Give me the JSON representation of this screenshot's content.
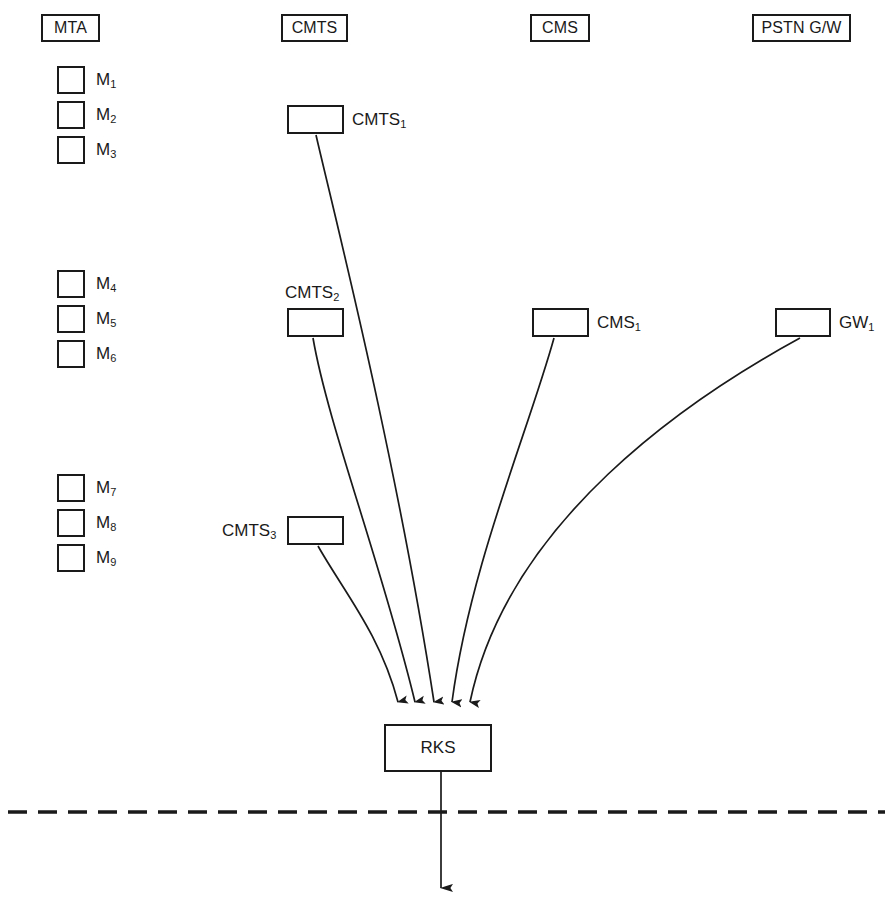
{
  "diagram": {
    "stroke_color": "#1a1a1a",
    "background_color": "#ffffff",
    "columns": [
      {
        "id": "mta",
        "label": "MTA",
        "x": 41,
        "y": 14,
        "w": 59,
        "h": 28
      },
      {
        "id": "cmts",
        "label": "CMTS",
        "x": 281,
        "y": 14,
        "w": 67,
        "h": 28
      },
      {
        "id": "cms",
        "label": "CMS",
        "x": 530,
        "y": 14,
        "w": 60,
        "h": 28
      },
      {
        "id": "pstn",
        "label": "PSTN G/W",
        "x": 752,
        "y": 14,
        "w": 99,
        "h": 28
      }
    ],
    "mta_terminals": [
      {
        "id": "m1",
        "base": "M",
        "sub": "1",
        "x": 57,
        "y": 66
      },
      {
        "id": "m2",
        "base": "M",
        "sub": "2",
        "x": 57,
        "y": 101
      },
      {
        "id": "m3",
        "base": "M",
        "sub": "3",
        "x": 57,
        "y": 136
      },
      {
        "id": "m4",
        "base": "M",
        "sub": "4",
        "x": 57,
        "y": 270
      },
      {
        "id": "m5",
        "base": "M",
        "sub": "5",
        "x": 57,
        "y": 305
      },
      {
        "id": "m6",
        "base": "M",
        "sub": "6",
        "x": 57,
        "y": 340
      },
      {
        "id": "m7",
        "base": "M",
        "sub": "7",
        "x": 57,
        "y": 474
      },
      {
        "id": "m8",
        "base": "M",
        "sub": "8",
        "x": 57,
        "y": 509
      },
      {
        "id": "m9",
        "base": "M",
        "sub": "9",
        "x": 57,
        "y": 544
      }
    ],
    "elements": [
      {
        "id": "cmts1",
        "base": "CMTS",
        "sub": "1",
        "x": 287,
        "y": 105,
        "w": 57,
        "h": 29,
        "label_side": "right"
      },
      {
        "id": "cmts2",
        "base": "CMTS",
        "sub": "2",
        "x": 287,
        "y": 308,
        "w": 57,
        "h": 29,
        "label_side": "above"
      },
      {
        "id": "cmts3",
        "base": "CMTS",
        "sub": "3",
        "x": 287,
        "y": 516,
        "w": 57,
        "h": 29,
        "label_side": "left"
      },
      {
        "id": "cms1",
        "base": "CMS",
        "sub": "1",
        "x": 532,
        "y": 308,
        "w": 57,
        "h": 29,
        "label_side": "right"
      },
      {
        "id": "gw1",
        "base": "GW",
        "sub": "1",
        "x": 775,
        "y": 308,
        "w": 56,
        "h": 29,
        "label_side": "right"
      }
    ],
    "rks": {
      "label": "RKS",
      "x": 384,
      "y": 724,
      "w": 108,
      "h": 48
    },
    "connections": [
      {
        "from": "cmts1",
        "to": "rks",
        "arrow_x": 434,
        "d": "M 316,135 C 340,200 392,450 434,700"
      },
      {
        "from": "cmts2",
        "to": "rks",
        "arrow_x": 415,
        "d": "M 313,338 C 330,420 380,560 415,700"
      },
      {
        "from": "cmts3",
        "to": "rks",
        "arrow_x": 398,
        "d": "M 318,546 C 340,590 378,630 398,700"
      },
      {
        "from": "cms1",
        "to": "rks",
        "arrow_x": 452,
        "d": "M 554,338 C 530,430 470,560 452,700"
      },
      {
        "from": "gw1",
        "to": "rks",
        "arrow_x": 470,
        "d": "M 800,338 C 700,400 510,520 470,700"
      }
    ],
    "boundary": {
      "type": "dashed-line",
      "y": 812,
      "x1": 8,
      "x2": 885
    },
    "output_arrow": {
      "x": 441,
      "y1": 772,
      "y2": 888
    }
  }
}
